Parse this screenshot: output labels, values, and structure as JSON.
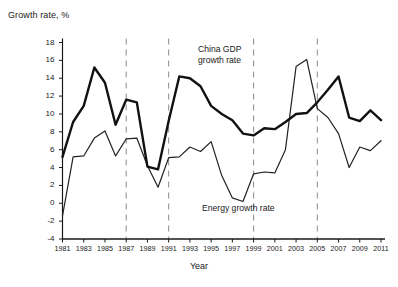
{
  "chart_data": {
    "type": "line",
    "title": "",
    "xlabel": "Year",
    "ylabel": "Growth rate, %",
    "ylim": [
      -4,
      18
    ],
    "xlim": [
      1981,
      2011
    ],
    "ytick_step": 2,
    "xtick_step": 2,
    "grid": false,
    "legend_position": "inline-annotation",
    "x": [
      1981,
      1982,
      1983,
      1984,
      1985,
      1986,
      1987,
      1988,
      1989,
      1990,
      1991,
      1992,
      1993,
      1994,
      1995,
      1996,
      1997,
      1998,
      1999,
      2000,
      2001,
      2002,
      2003,
      2004,
      2005,
      2006,
      2007,
      2008,
      2009,
      2010,
      2011
    ],
    "yticks": [
      -4,
      -2,
      0,
      2,
      4,
      6,
      8,
      10,
      12,
      14,
      16,
      18
    ],
    "ytick_labels": [
      "-4",
      "-2",
      "0",
      "2",
      "4",
      "6",
      "8",
      "10",
      "12",
      "14",
      "16",
      "18"
    ],
    "xticks": [
      1981,
      1983,
      1985,
      1987,
      1989,
      1991,
      1993,
      1995,
      1997,
      1999,
      2001,
      2003,
      2005,
      2007,
      2009,
      2011
    ],
    "xtick_labels": [
      "1981",
      "1983",
      "1985",
      "1987",
      "1989",
      "1991",
      "1993",
      "1995",
      "1997",
      "1999",
      "2001",
      "2003",
      "2005",
      "2007",
      "2009",
      "2011"
    ],
    "reference_lines": [
      1987,
      1991,
      1999,
      2005
    ],
    "reference_line_style": "dashed",
    "reference_line_color": "#8c8c8c",
    "series": [
      {
        "name": "China GDP growth rate",
        "color": "#111111",
        "line_width": 2.4,
        "annotation": "China GDP\ngrowth rate",
        "values": [
          5.2,
          9.1,
          10.9,
          15.2,
          13.5,
          8.8,
          11.6,
          11.3,
          4.1,
          3.8,
          9.2,
          14.2,
          14.0,
          13.1,
          10.9,
          10.0,
          9.3,
          7.8,
          7.6,
          8.4,
          8.3,
          9.1,
          10.0,
          10.1,
          11.3,
          12.7,
          14.2,
          9.6,
          9.2,
          10.4,
          9.3
        ]
      },
      {
        "name": "Energy growth rate",
        "color": "#222222",
        "line_width": 1.2,
        "annotation": "Energy growth rate",
        "values": [
          -1.4,
          5.2,
          5.3,
          7.3,
          8.1,
          5.3,
          7.2,
          7.3,
          4.2,
          1.8,
          5.1,
          5.2,
          6.3,
          5.8,
          6.9,
          3.1,
          0.6,
          0.2,
          3.3,
          3.5,
          3.4,
          6.0,
          15.3,
          16.1,
          10.6,
          9.6,
          7.8,
          4.0,
          6.3,
          5.9,
          7.0
        ]
      }
    ]
  },
  "axis": {
    "ylabel_text": "Growth rate, %",
    "xlabel_text": "Year"
  },
  "annotations": {
    "gdp_line1": "China GDP",
    "gdp_line2": "growth rate",
    "energy": "Energy growth rate"
  },
  "colors": {
    "background": "#ffffff",
    "axis": "#1a1a1a",
    "gdp_line": "#111111",
    "energy_line": "#222222",
    "reference_line": "#8c8c8c"
  }
}
